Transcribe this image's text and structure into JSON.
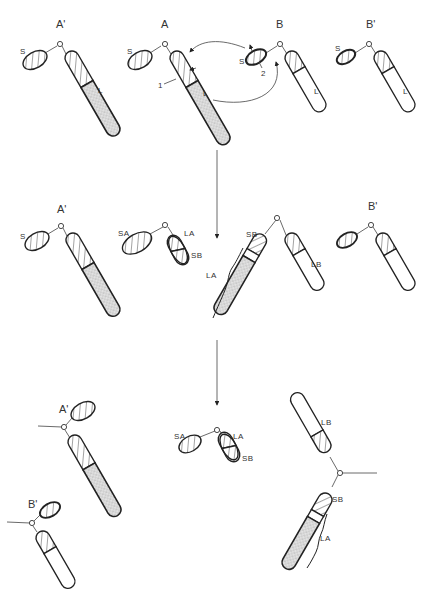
{
  "figure": {
    "stages": [
      {
        "name": "stage-1-normal",
        "labels": {
          "A_prime": "A'",
          "A": "A",
          "B": "B",
          "B_prime": "B'",
          "short_arm": "S",
          "long_arm": "L",
          "break_1": "1",
          "break_2": "2"
        }
      },
      {
        "name": "stage-2-translocation",
        "labels": {
          "A_prime": "A'",
          "B_prime": "B'",
          "SA": "SA",
          "LA": "LA",
          "SB": "SB",
          "LB": "LB",
          "short_arm": "S"
        }
      },
      {
        "name": "stage-3-segregation",
        "labels": {
          "A_prime": "A'",
          "B_prime": "B'",
          "SA": "SA",
          "LA": "LA",
          "SB": "SB",
          "LB": "LB"
        }
      }
    ]
  },
  "colors": {
    "line": "#222222",
    "label": "#333333",
    "stipple": "#9a9a9a",
    "background": "#ffffff"
  }
}
